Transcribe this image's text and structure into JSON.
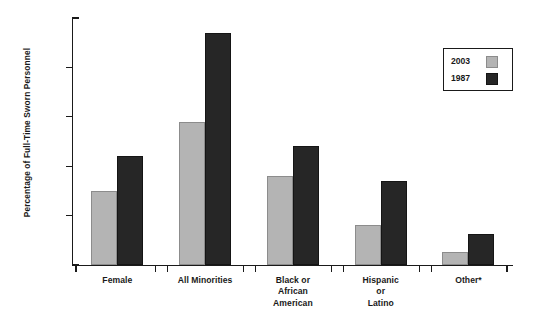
{
  "chart_data": {
    "type": "bar",
    "title": "",
    "xlabel": "",
    "ylabel": "Percentage of Full-Time Sworn Personnel",
    "ylim": [
      0,
      25
    ],
    "yticks": [
      0,
      5,
      10,
      15,
      20,
      25
    ],
    "ytick_labels": [
      "0%",
      "5%",
      "10%",
      "15%",
      "20%",
      "25%"
    ],
    "grid": false,
    "legend_position": "upper right",
    "categories": [
      "Female",
      "All Minorities",
      "Black or African American",
      "Hispanic or Latino",
      "Other*"
    ],
    "category_lines": [
      [
        "Female"
      ],
      [
        "All Minorities"
      ],
      [
        "Black or",
        "African",
        "American"
      ],
      [
        "Hispanic",
        "or",
        "Latino"
      ],
      [
        "Other*"
      ]
    ],
    "series": [
      {
        "name": "2003",
        "color": "#b4b4b4",
        "values": [
          7.5,
          14.5,
          9.0,
          4.0,
          1.3
        ]
      },
      {
        "name": "1987",
        "color": "#262626",
        "values": [
          11.0,
          23.5,
          12.0,
          8.5,
          3.1
        ]
      }
    ]
  },
  "legend": {
    "entries": [
      {
        "label": "2003",
        "swatch": "light-gray-swatch"
      },
      {
        "label": "1987",
        "swatch": "dark-swatch"
      }
    ]
  }
}
